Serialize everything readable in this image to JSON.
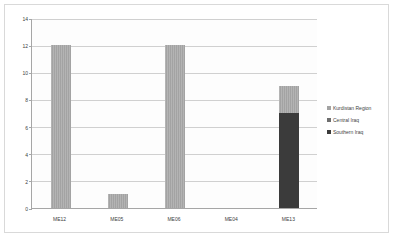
{
  "chart_data": {
    "type": "bar",
    "stacked": true,
    "title": "",
    "subtitle": "",
    "xlabel": "",
    "ylabel": "",
    "categories": [
      "ME12",
      "ME05",
      "ME06",
      "ME04",
      "ME13"
    ],
    "series": [
      {
        "name": "Kurdistan Region",
        "color": "#a3a3a3",
        "values": [
          12,
          1,
          12,
          0,
          2
        ]
      },
      {
        "name": "Central Iraq",
        "color": "#6e6e6e",
        "values": [
          0,
          0,
          0,
          0,
          0
        ]
      },
      {
        "name": "Southern Iraq",
        "color": "#3b3b3b",
        "values": [
          0,
          0,
          0,
          0,
          7
        ]
      }
    ],
    "totals": [
      12,
      1,
      12,
      0,
      9
    ],
    "ylim": [
      0,
      14
    ],
    "yticks": [
      0,
      2,
      4,
      6,
      8,
      10,
      12,
      14
    ],
    "ytick_labels": [
      "0",
      "2",
      "4",
      "6",
      "8",
      "10",
      "12",
      "14"
    ],
    "grid": true,
    "legend_position": "right"
  },
  "legend": {
    "items": [
      {
        "label": "Kurdistan Region",
        "color": "#a3a3a3"
      },
      {
        "label": "Central Iraq",
        "color": "#6e6e6e"
      },
      {
        "label": "Southern Iraq",
        "color": "#3b3b3b"
      }
    ]
  },
  "axes": {
    "y_labels": [
      "14",
      "12",
      "10",
      "8",
      "6",
      "4",
      "2",
      "0"
    ],
    "x_labels": [
      "ME12",
      "ME05",
      "ME06",
      "ME04",
      "ME13"
    ]
  }
}
